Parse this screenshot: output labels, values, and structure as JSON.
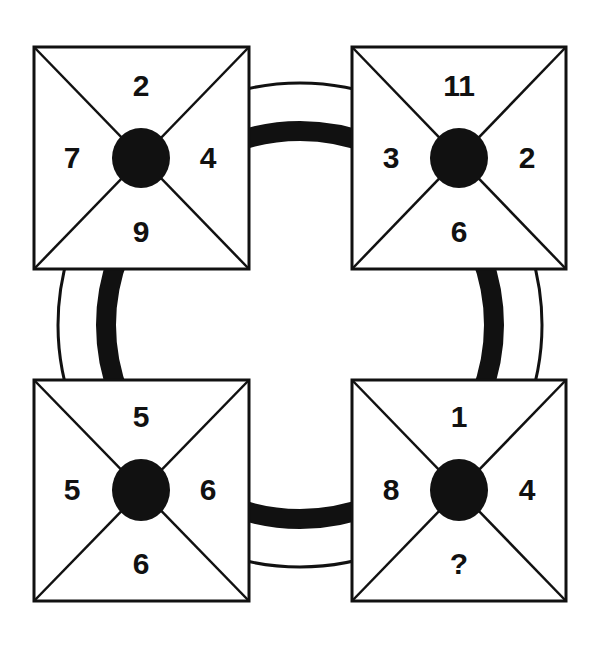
{
  "puzzle": {
    "boxes": [
      {
        "id": "top-left",
        "top": "2",
        "right": "4",
        "bottom": "9",
        "left": "7"
      },
      {
        "id": "top-right",
        "top": "11",
        "right": "2",
        "bottom": "6",
        "left": "3"
      },
      {
        "id": "bottom-left",
        "top": "5",
        "right": "6",
        "bottom": "6",
        "left": "5"
      },
      {
        "id": "bottom-right",
        "top": "1",
        "right": "4",
        "bottom": "?",
        "left": "8"
      }
    ],
    "colors": {
      "ink": "#111111",
      "background": "#ffffff"
    }
  }
}
